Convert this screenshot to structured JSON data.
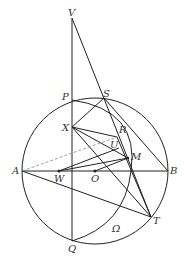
{
  "diagram": {
    "labels": {
      "V": "V",
      "P": "P",
      "S": "S",
      "X": "X",
      "R": "R",
      "U": "U",
      "M": "M",
      "A": "A",
      "W": "W",
      "O": "O",
      "B": "B",
      "T": "T",
      "Q": "Q",
      "Omega": "Ω"
    },
    "points": {
      "V": [
        72,
        18
      ],
      "P": [
        72,
        100
      ],
      "S": [
        104,
        98
      ],
      "X": [
        72,
        127
      ],
      "R": [
        117,
        137
      ],
      "U": [
        119,
        148
      ],
      "M": [
        128,
        158
      ],
      "A": [
        22,
        171
      ],
      "W": [
        59,
        171
      ],
      "O": [
        95,
        171
      ],
      "B": [
        168,
        171
      ],
      "T": [
        151,
        217
      ],
      "Q": [
        72,
        241
      ]
    },
    "circle_main": {
      "cx": 95,
      "cy": 171,
      "r": 73
    },
    "colors": {
      "line": "#222222",
      "dashed": "#888888"
    }
  }
}
